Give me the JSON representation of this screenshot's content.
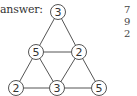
{
  "label": "answer:",
  "colors": {
    "stroke": "#555555",
    "text": "#333333",
    "fill": "#ffffff"
  },
  "nodes": [
    {
      "id": "top",
      "value": "3",
      "x": 58,
      "y": 12
    },
    {
      "id": "mid-left",
      "value": "5",
      "x": 36,
      "y": 52
    },
    {
      "id": "mid-right",
      "value": "2",
      "x": 79,
      "y": 52
    },
    {
      "id": "bottom-left",
      "value": "2",
      "x": 16,
      "y": 88
    },
    {
      "id": "bottom-center",
      "value": "3",
      "x": 57,
      "y": 88
    },
    {
      "id": "bottom-right",
      "value": "5",
      "x": 99,
      "y": 88
    }
  ],
  "edges": [
    [
      "top",
      "mid-left"
    ],
    [
      "top",
      "mid-right"
    ],
    [
      "mid-left",
      "mid-right"
    ],
    [
      "mid-left",
      "bottom-left"
    ],
    [
      "mid-left",
      "bottom-center"
    ],
    [
      "mid-right",
      "bottom-center"
    ],
    [
      "mid-right",
      "bottom-right"
    ],
    [
      "bottom-left",
      "bottom-center"
    ],
    [
      "bottom-center",
      "bottom-right"
    ]
  ],
  "side_text": [
    "7",
    "9",
    "2"
  ]
}
